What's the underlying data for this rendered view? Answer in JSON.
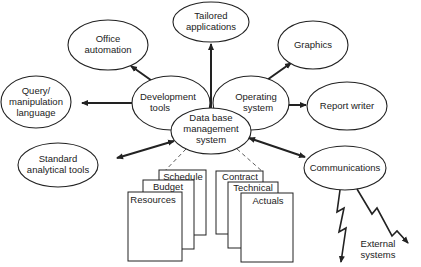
{
  "diagram": {
    "center": {
      "lines": [
        "Data base",
        "management",
        "system"
      ]
    },
    "nodes": {
      "tailored": {
        "lines": [
          "Tailored",
          "applications"
        ]
      },
      "office": {
        "lines": [
          "Office",
          "automation"
        ]
      },
      "graphics": {
        "lines": [
          "Graphics"
        ]
      },
      "query": {
        "lines": [
          "Query/",
          "manipulation",
          "language"
        ]
      },
      "devtools": {
        "lines": [
          "Development",
          "tools"
        ]
      },
      "opsys": {
        "lines": [
          "Operating",
          "system"
        ]
      },
      "report": {
        "lines": [
          "Report writer"
        ]
      },
      "analytical": {
        "lines": [
          "Standard",
          "analytical tools"
        ]
      },
      "comms": {
        "lines": [
          "Communications"
        ]
      }
    },
    "documents_left": [
      "Schedule",
      "Budget",
      "Resources"
    ],
    "documents_right": [
      "Contract",
      "Technical",
      "Actuals"
    ],
    "external": {
      "lines": [
        "External",
        "systems"
      ]
    }
  }
}
